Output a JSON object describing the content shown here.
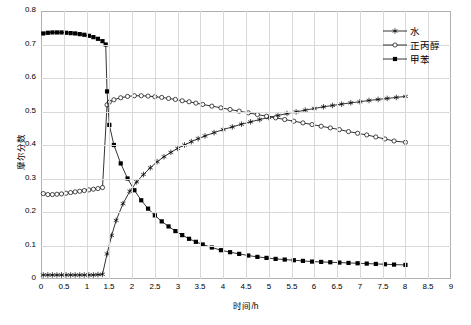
{
  "chart_data": {
    "type": "line",
    "title": "",
    "xlabel": "时间/h",
    "ylabel": "摩尔分数",
    "xlim": [
      0,
      9
    ],
    "ylim": [
      0,
      0.8
    ],
    "xticks": [
      "0",
      "0.5",
      "1",
      "1.5",
      "2",
      "2.5",
      "3",
      "3.5",
      "4",
      "4.5",
      "5",
      "5.5",
      "6",
      "6.5",
      "7",
      "7.5",
      "8",
      "8.5",
      "9"
    ],
    "yticks": [
      "0",
      "0.1",
      "0.2",
      "0.3",
      "0.4",
      "0.5",
      "0.6",
      "0.7",
      "0.8"
    ],
    "grid": true,
    "legend_position": "top-right",
    "series": [
      {
        "name": "水",
        "marker": "star",
        "x": [
          0.05,
          0.15,
          0.25,
          0.35,
          0.45,
          0.55,
          0.65,
          0.75,
          0.85,
          0.95,
          1.05,
          1.15,
          1.25,
          1.35,
          1.45,
          1.55,
          1.65,
          1.8,
          1.95,
          2.1,
          2.25,
          2.4,
          2.55,
          2.7,
          2.85,
          3.0,
          3.15,
          3.3,
          3.45,
          3.6,
          3.8,
          4.0,
          4.2,
          4.4,
          4.6,
          4.8,
          5.0,
          5.2,
          5.4,
          5.6,
          5.8,
          6.0,
          6.2,
          6.4,
          6.6,
          6.8,
          7.0,
          7.2,
          7.4,
          7.6,
          7.8,
          8.0
        ],
        "y": [
          0.012,
          0.012,
          0.012,
          0.012,
          0.012,
          0.012,
          0.012,
          0.012,
          0.012,
          0.012,
          0.012,
          0.012,
          0.013,
          0.014,
          0.075,
          0.13,
          0.175,
          0.225,
          0.262,
          0.29,
          0.312,
          0.332,
          0.35,
          0.365,
          0.378,
          0.39,
          0.4,
          0.41,
          0.419,
          0.427,
          0.437,
          0.446,
          0.454,
          0.462,
          0.469,
          0.476,
          0.482,
          0.488,
          0.494,
          0.499,
          0.504,
          0.509,
          0.514,
          0.518,
          0.522,
          0.526,
          0.529,
          0.533,
          0.536,
          0.539,
          0.542,
          0.545
        ]
      },
      {
        "name": "正丙醇",
        "marker": "circle",
        "x": [
          0.05,
          0.15,
          0.25,
          0.35,
          0.45,
          0.55,
          0.65,
          0.75,
          0.85,
          0.95,
          1.05,
          1.15,
          1.25,
          1.35,
          1.45,
          1.5,
          1.6,
          1.75,
          1.9,
          2.05,
          2.2,
          2.35,
          2.5,
          2.65,
          2.8,
          2.95,
          3.1,
          3.25,
          3.4,
          3.55,
          3.75,
          3.95,
          4.15,
          4.35,
          4.55,
          4.75,
          4.95,
          5.15,
          5.35,
          5.55,
          5.75,
          5.95,
          6.15,
          6.35,
          6.55,
          6.75,
          6.95,
          7.15,
          7.35,
          7.55,
          7.75,
          8.0
        ],
        "y": [
          0.255,
          0.252,
          0.252,
          0.253,
          0.254,
          0.256,
          0.258,
          0.26,
          0.262,
          0.264,
          0.266,
          0.268,
          0.27,
          0.273,
          0.52,
          0.528,
          0.535,
          0.541,
          0.545,
          0.547,
          0.547,
          0.546,
          0.544,
          0.542,
          0.539,
          0.536,
          0.532,
          0.529,
          0.525,
          0.521,
          0.516,
          0.511,
          0.506,
          0.501,
          0.496,
          0.491,
          0.486,
          0.481,
          0.476,
          0.471,
          0.466,
          0.461,
          0.456,
          0.451,
          0.446,
          0.44,
          0.435,
          0.43,
          0.424,
          0.418,
          0.412,
          0.408
        ]
      },
      {
        "name": "甲苯",
        "marker": "square",
        "x": [
          0.05,
          0.15,
          0.25,
          0.35,
          0.45,
          0.55,
          0.65,
          0.75,
          0.85,
          0.95,
          1.05,
          1.15,
          1.25,
          1.35,
          1.42,
          1.45,
          1.5,
          1.6,
          1.75,
          1.9,
          2.05,
          2.2,
          2.35,
          2.5,
          2.65,
          2.8,
          2.95,
          3.1,
          3.25,
          3.4,
          3.55,
          3.75,
          3.95,
          4.15,
          4.35,
          4.55,
          4.75,
          4.95,
          5.15,
          5.35,
          5.55,
          5.75,
          5.95,
          6.15,
          6.35,
          6.55,
          6.75,
          6.95,
          7.15,
          7.35,
          7.55,
          7.75,
          8.0
        ],
        "y": [
          0.733,
          0.735,
          0.736,
          0.736,
          0.736,
          0.735,
          0.734,
          0.733,
          0.731,
          0.729,
          0.726,
          0.722,
          0.717,
          0.71,
          0.7,
          0.56,
          0.46,
          0.4,
          0.345,
          0.3,
          0.265,
          0.235,
          0.21,
          0.19,
          0.172,
          0.157,
          0.143,
          0.131,
          0.12,
          0.111,
          0.103,
          0.094,
          0.086,
          0.08,
          0.075,
          0.07,
          0.066,
          0.063,
          0.06,
          0.058,
          0.056,
          0.054,
          0.052,
          0.051,
          0.05,
          0.049,
          0.048,
          0.047,
          0.046,
          0.045,
          0.044,
          0.043,
          0.042
        ]
      }
    ]
  },
  "legend": {
    "entries": [
      {
        "label": "水"
      },
      {
        "label": "正丙醇"
      },
      {
        "label": "甲苯"
      }
    ]
  },
  "axes": {
    "x_title": "时间/h",
    "y_title": "摩尔分数"
  }
}
